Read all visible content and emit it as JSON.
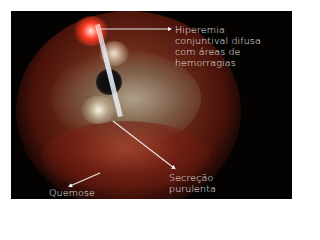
{
  "figure": {
    "annotations": [
      {
        "id": "hiperemia",
        "lines": [
          "Hiperemia",
          "conjuntival difusa",
          "com áreas de",
          "hemorragias"
        ]
      },
      {
        "id": "secrecao",
        "lines": [
          "Secreção",
          "purulenta"
        ]
      },
      {
        "id": "quemose",
        "lines": [
          "Quemose"
        ]
      }
    ],
    "colors": {
      "background": "#050302",
      "sclera_red": "#7a1a10",
      "highlight": "#ffffff",
      "label_text": "#f2f2f2"
    }
  }
}
